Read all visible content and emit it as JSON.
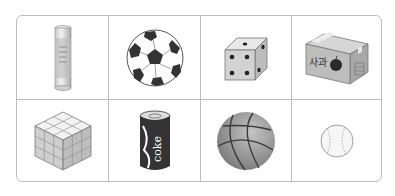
{
  "grid": {
    "rows": 2,
    "columns": 4,
    "border_color": "#bdbdbd",
    "items": [
      {
        "name": "glue stick",
        "row": 1,
        "col": 1
      },
      {
        "name": "soccer ball",
        "row": 1,
        "col": 2
      },
      {
        "name": "die",
        "row": 1,
        "col": 3
      },
      {
        "name": "apple box",
        "row": 1,
        "col": 4,
        "label": "사과"
      },
      {
        "name": "rubik's cube",
        "row": 2,
        "col": 1
      },
      {
        "name": "coke can",
        "row": 2,
        "col": 2,
        "label": "coke"
      },
      {
        "name": "basketball",
        "row": 2,
        "col": 3
      },
      {
        "name": "baseball",
        "row": 2,
        "col": 4
      }
    ]
  }
}
